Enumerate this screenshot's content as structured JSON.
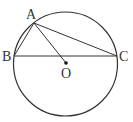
{
  "diagram": {
    "type": "geometry",
    "stroke_color": "#333333",
    "circle": {
      "cx": 65.5,
      "cy": 64,
      "r": 52
    },
    "points": {
      "A": {
        "label": "A",
        "x": 34,
        "y": 23
      },
      "B": {
        "label": "B",
        "x": 14,
        "y": 56
      },
      "C": {
        "label": "C",
        "x": 117,
        "y": 56
      },
      "O": {
        "label": "O",
        "x": 66,
        "y": 63
      }
    },
    "segments": [
      "AB",
      "AC",
      "AO",
      "BC"
    ]
  }
}
